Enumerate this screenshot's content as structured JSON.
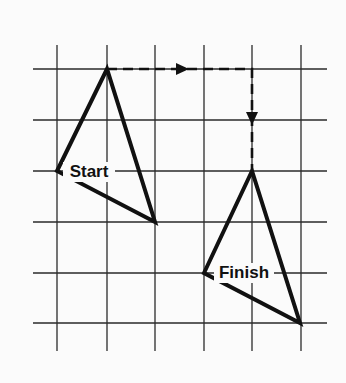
{
  "diagram": {
    "type": "grid-translation",
    "grid": {
      "vertical_x": [
        57,
        107,
        155,
        204,
        252,
        301
      ],
      "horizontal_y": [
        69,
        120,
        171,
        222,
        273,
        323
      ],
      "x_extent": [
        33,
        327
      ],
      "y_extent": [
        45,
        351
      ]
    },
    "shapes": [
      {
        "name": "start-triangle",
        "label": "Start",
        "points": [
          [
            107,
            69
          ],
          [
            57,
            171
          ],
          [
            155,
            222
          ]
        ],
        "label_pos": [
          89,
          177
        ]
      },
      {
        "name": "finish-triangle",
        "label": "Finish",
        "points": [
          [
            252,
            171
          ],
          [
            204,
            273
          ],
          [
            300,
            323
          ]
        ],
        "label_pos": [
          244,
          278
        ]
      }
    ],
    "translation_path": {
      "segments": [
        {
          "from": [
            107,
            69
          ],
          "to": [
            252,
            69
          ],
          "arrow_at": [
            189,
            69
          ],
          "direction": "right"
        },
        {
          "from": [
            252,
            69
          ],
          "to": [
            252,
            171
          ],
          "arrow_at": [
            252,
            125
          ],
          "direction": "down"
        }
      ],
      "grid_units": {
        "right": 3,
        "down": 2
      }
    },
    "colors": {
      "line": "#111111",
      "grid": "#2a2a2a",
      "background": "#fbfbfb"
    }
  }
}
